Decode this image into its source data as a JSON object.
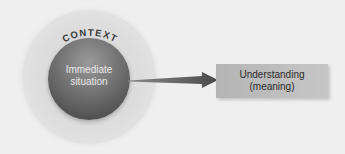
{
  "diagram": {
    "outer_circle": {
      "label": "CONTEXT",
      "color": "#dcdcdc"
    },
    "inner_sphere": {
      "line1": "Immediate",
      "line2": "situation",
      "color": "#6a6a6a"
    },
    "arrow": {
      "direction": "right",
      "color": "#555555"
    },
    "target_box": {
      "line1": "Understanding",
      "line2": "(meaning)",
      "color": "#bdbdbd"
    }
  }
}
